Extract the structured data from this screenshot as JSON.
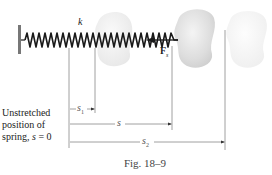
{
  "figure": {
    "caption": "Fig. 18–9"
  },
  "labels": {
    "spring_constant": "k",
    "spring_force": "F",
    "spring_force_subscript": "s",
    "s1": "s",
    "s1_subscript": "1",
    "s": "s",
    "s2": "s",
    "s2_subscript": "2"
  },
  "note": {
    "line1": "Unstretched",
    "line2": "position of",
    "line3_prefix": "spring, ",
    "line3_var": "s",
    "line3_suffix": " = 0"
  },
  "colors": {
    "spring": "#1a1a1a",
    "wall": "#777777",
    "dimension_lines": "#888888",
    "block_solid": "#dcdcdc",
    "block_faded": "#ececec",
    "block_faintest": "#f3f3f3"
  }
}
